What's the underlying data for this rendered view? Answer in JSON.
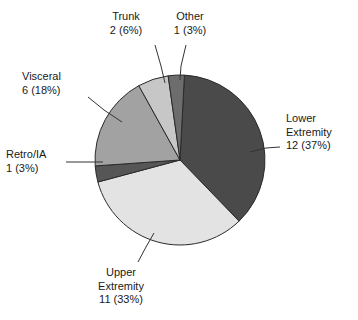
{
  "chart_data": {
    "type": "pie",
    "title": "",
    "subtitle": "",
    "xlabel": "",
    "ylabel": "",
    "legend_position": "callouts",
    "grid": false,
    "total": 33,
    "categories": [
      "Lower Extremity",
      "Upper Extremity",
      "Retro/IA",
      "Visceral",
      "Trunk",
      "Other"
    ],
    "values": [
      12,
      11,
      1,
      6,
      2,
      1
    ],
    "percentages": [
      37,
      33,
      3,
      18,
      6,
      3
    ],
    "slices": [
      {
        "name": "Lower Extremity",
        "label_line1": "Lower",
        "label_line2": "Extremity",
        "label_line3": "12 (37%)",
        "value": 12,
        "percent": 37,
        "percent_text": "37%",
        "color": "#4a4a4a",
        "start_angle": 3,
        "end_angle": 136
      },
      {
        "name": "Upper Extremity",
        "label_line1": "Upper",
        "label_line2": "Extremity",
        "label_line3": "11 (33%)",
        "value": 11,
        "percent": 33,
        "percent_text": "33%",
        "color": "#e3e3e3",
        "start_angle": 136,
        "end_angle": 255
      },
      {
        "name": "Retro/IA",
        "label_line1": "Retro/IA",
        "label_line2": "1 (3%)",
        "label_line3": "",
        "value": 1,
        "percent": 3,
        "percent_text": "3%",
        "color": "#565656",
        "start_angle": 255,
        "end_angle": 266
      },
      {
        "name": "Visceral",
        "label_line1": "Visceral",
        "label_line2": "6 (18%)",
        "label_line3": "",
        "value": 6,
        "percent": 18,
        "percent_text": "18%",
        "color": "#a2a2a2",
        "start_angle": 266,
        "end_angle": 331
      },
      {
        "name": "Trunk",
        "label_line1": "Trunk",
        "label_line2": "2 (6%)",
        "label_line3": "",
        "value": 2,
        "percent": 6,
        "percent_text": "6%",
        "color": "#c7c7c7",
        "start_angle": 331,
        "end_angle": 352
      },
      {
        "name": "Other",
        "label_line1": "Other",
        "label_line2": "1 (3%)",
        "label_line3": "",
        "value": 1,
        "percent": 3,
        "percent_text": "3%",
        "color": "#6d6d6d",
        "start_angle": 352,
        "end_angle": 363
      }
    ],
    "geometry": {
      "center_x": 180,
      "center_y": 160,
      "radius": 85
    },
    "colors": {
      "background": "#ffffff",
      "outline": "#2a2a2a",
      "text": "#1a1a1a",
      "leader": "#333333"
    }
  }
}
